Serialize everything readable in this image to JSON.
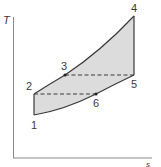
{
  "diagram": {
    "type": "T-s diagram",
    "axes": {
      "y_label": "T",
      "x_label": "s"
    },
    "points": [
      {
        "id": "1",
        "label": "1"
      },
      {
        "id": "2",
        "label": "2"
      },
      {
        "id": "3",
        "label": "3"
      },
      {
        "id": "4",
        "label": "4"
      },
      {
        "id": "5",
        "label": "5"
      },
      {
        "id": "6",
        "label": "6"
      }
    ],
    "processes": [
      {
        "from": "1",
        "to": "2",
        "style": "solid"
      },
      {
        "from": "2",
        "to": "3",
        "style": "solid-curve"
      },
      {
        "from": "3",
        "to": "4",
        "style": "solid-curve"
      },
      {
        "from": "4",
        "to": "5",
        "style": "solid"
      },
      {
        "from": "5",
        "to": "6",
        "style": "solid-curve"
      },
      {
        "from": "6",
        "to": "1",
        "style": "solid-curve"
      },
      {
        "from": "3",
        "to": "5",
        "style": "dashed"
      },
      {
        "from": "2",
        "to": "6",
        "style": "dashed"
      }
    ],
    "colors": {
      "fill": "#dcdcdc",
      "line": "#3a3a3a",
      "axis": "#8a8a8a"
    }
  }
}
